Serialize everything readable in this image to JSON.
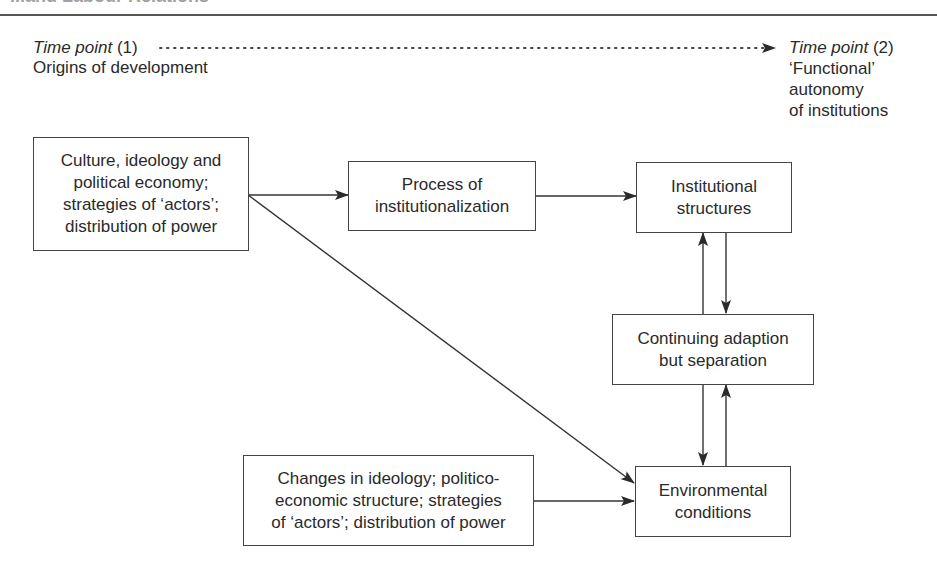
{
  "header": {
    "title": "...and Labour Relations"
  },
  "timeline": {
    "start": {
      "label_italic": "Time point",
      "label_num": " (1)",
      "caption": "Origins of development"
    },
    "end": {
      "label_italic": "Time point",
      "label_num": " (2)",
      "caption": "‘Functional’\nautonomy\nof institutions"
    }
  },
  "nodes": {
    "culture": "Culture, ideology and\npolitical economy;\nstrategies of ‘actors’;\ndistribution of power",
    "process": "Process of\ninstitutionalization",
    "institutional": "Institutional\nstructures",
    "continuing": "Continuing adaption\nbut separation",
    "environmental": "Environmental\nconditions",
    "changes": "Changes in ideology; politico-\neconomic structure; strategies\nof ‘actors’; distribution of power"
  },
  "edges": [
    {
      "from": "culture",
      "to": "process"
    },
    {
      "from": "process",
      "to": "institutional"
    },
    {
      "from": "culture",
      "to": "environmental"
    },
    {
      "from": "continuing",
      "to": "institutional"
    },
    {
      "from": "institutional",
      "to": "continuing"
    },
    {
      "from": "continuing",
      "to": "environmental"
    },
    {
      "from": "environmental",
      "to": "continuing"
    },
    {
      "from": "changes",
      "to": "environmental"
    },
    {
      "from": "time_point_1",
      "to": "time_point_2",
      "style": "dotted"
    }
  ],
  "colors": {
    "line": "#333333",
    "text": "#2a2a2a",
    "background": "#ffffff"
  }
}
